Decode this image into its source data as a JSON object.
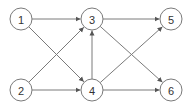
{
  "diagram": {
    "type": "directed-graph",
    "nodes": [
      {
        "id": "1",
        "label": "1",
        "x": 21,
        "y": 19
      },
      {
        "id": "2",
        "label": "2",
        "x": 21,
        "y": 90
      },
      {
        "id": "3",
        "label": "3",
        "x": 92,
        "y": 19
      },
      {
        "id": "4",
        "label": "4",
        "x": 92,
        "y": 90
      },
      {
        "id": "5",
        "label": "5",
        "x": 171,
        "y": 19
      },
      {
        "id": "6",
        "label": "6",
        "x": 171,
        "y": 90
      }
    ],
    "edges": [
      {
        "from": "1",
        "to": "3"
      },
      {
        "from": "1",
        "to": "4"
      },
      {
        "from": "2",
        "to": "3"
      },
      {
        "from": "2",
        "to": "4"
      },
      {
        "from": "4",
        "to": "3"
      },
      {
        "from": "3",
        "to": "5"
      },
      {
        "from": "3",
        "to": "6"
      },
      {
        "from": "4",
        "to": "5"
      },
      {
        "from": "4",
        "to": "6"
      }
    ],
    "node_radius": 11,
    "colors": {
      "stroke": "#7a7a7a",
      "text": "#333333",
      "background": "#ffffff"
    }
  }
}
